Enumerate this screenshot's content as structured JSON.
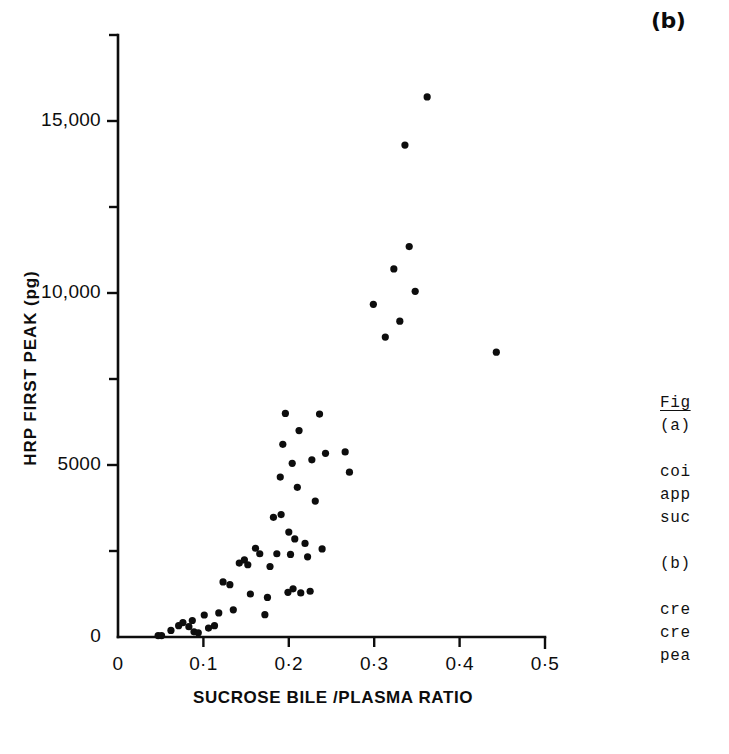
{
  "figure": {
    "panel_label": "(b)",
    "background_color": "#ffffff",
    "ink_color": "#0d0d0d"
  },
  "caption": {
    "heading": "Fig",
    "lines": [
      "(a)",
      "",
      "coi",
      "app",
      "suc",
      "",
      "(b)",
      "",
      "cre",
      "cre",
      "pea"
    ]
  },
  "chart_data": {
    "type": "scatter",
    "title": "",
    "subtitle": "",
    "xlabel": "SUCROSE BILE /PLASMA RATIO",
    "ylabel": "HRP FIRST PEAK (pg)",
    "xlim": [
      0,
      0.5
    ],
    "ylim": [
      0,
      17500
    ],
    "grid": false,
    "legend": null,
    "annotations": [
      "(b)"
    ],
    "x_ticks": [
      0,
      0.1,
      0.2,
      0.3,
      0.4,
      0.5
    ],
    "x_tick_labels": [
      "0",
      "0·1",
      "0·2",
      "0·3",
      "0·4",
      "0·5"
    ],
    "y_ticks": [
      0,
      2500,
      5000,
      7500,
      10000,
      12500,
      15000,
      17500
    ],
    "y_tick_labels": [
      "0",
      "",
      "5000",
      "",
      "10,000",
      "",
      "15,000",
      ""
    ],
    "marker": "filled-circle",
    "marker_color": "#0d0d0d",
    "marker_size_px": 6,
    "n_points": 60,
    "points": [
      [
        0.047,
        40
      ],
      [
        0.051,
        40
      ],
      [
        0.062,
        190
      ],
      [
        0.071,
        330
      ],
      [
        0.076,
        420
      ],
      [
        0.083,
        300
      ],
      [
        0.087,
        480
      ],
      [
        0.089,
        150
      ],
      [
        0.094,
        120
      ],
      [
        0.101,
        640
      ],
      [
        0.113,
        330
      ],
      [
        0.123,
        1600
      ],
      [
        0.131,
        1520
      ],
      [
        0.135,
        790
      ],
      [
        0.142,
        2150
      ],
      [
        0.148,
        2240
      ],
      [
        0.155,
        1250
      ],
      [
        0.161,
        2580
      ],
      [
        0.166,
        2420
      ],
      [
        0.172,
        650
      ],
      [
        0.178,
        2050
      ],
      [
        0.182,
        3480
      ],
      [
        0.186,
        2420
      ],
      [
        0.19,
        4650
      ],
      [
        0.193,
        5600
      ],
      [
        0.196,
        6500
      ],
      [
        0.199,
        1300
      ],
      [
        0.2,
        3050
      ],
      [
        0.202,
        2400
      ],
      [
        0.204,
        5050
      ],
      [
        0.205,
        1400
      ],
      [
        0.207,
        2850
      ],
      [
        0.21,
        4350
      ],
      [
        0.212,
        6000
      ],
      [
        0.214,
        1280
      ],
      [
        0.219,
        2720
      ],
      [
        0.222,
        2330
      ],
      [
        0.227,
        5150
      ],
      [
        0.231,
        3950
      ],
      [
        0.236,
        6480
      ],
      [
        0.239,
        2560
      ],
      [
        0.243,
        5340
      ],
      [
        0.266,
        5380
      ],
      [
        0.271,
        4790
      ],
      [
        0.299,
        9670
      ],
      [
        0.313,
        8720
      ],
      [
        0.323,
        10700
      ],
      [
        0.33,
        9180
      ],
      [
        0.336,
        14300
      ],
      [
        0.341,
        11350
      ],
      [
        0.348,
        10050
      ],
      [
        0.362,
        15700
      ],
      [
        0.385,
        18700
      ],
      [
        0.443,
        8280
      ],
      [
        0.106,
        260
      ],
      [
        0.118,
        700
      ],
      [
        0.152,
        2100
      ],
      [
        0.175,
        1150
      ],
      [
        0.191,
        3560
      ],
      [
        0.225,
        1330
      ]
    ]
  }
}
